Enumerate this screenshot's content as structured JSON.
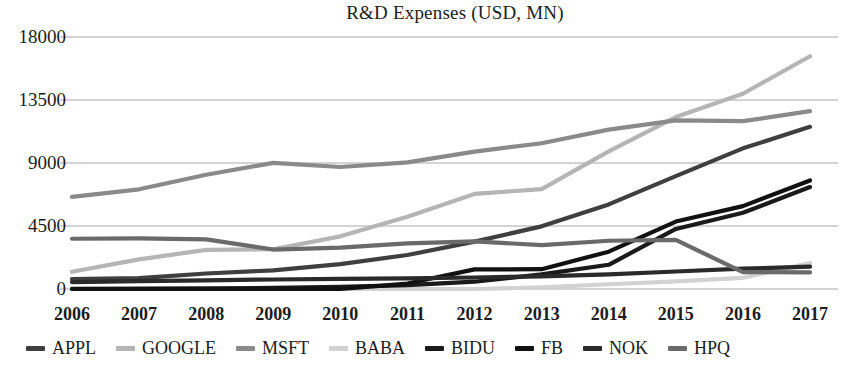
{
  "chart_data": {
    "type": "line",
    "title": "R&D Expenses (USD, MN)",
    "xlabel": "",
    "ylabel": "",
    "grid": true,
    "legend_position": "bottom",
    "categories": [
      "2006",
      "2007",
      "2008",
      "2009",
      "2010",
      "2011",
      "2012",
      "2013",
      "2014",
      "2015",
      "2016",
      "2017"
    ],
    "ylim": [
      0,
      18000
    ],
    "yticks": [
      0,
      4500,
      9000,
      13500,
      18000
    ],
    "ytick_labels": [
      "0",
      "4500",
      "9000",
      "13500",
      "18000"
    ],
    "series": [
      {
        "name": "APPL",
        "color": "#3f3f3f",
        "values": [
          712,
          782,
          1109,
          1333,
          1782,
          2429,
          3381,
          4475,
          6041,
          8067,
          10045,
          11581
        ]
      },
      {
        "name": "GOOGLE",
        "color": "#b5b5b5",
        "values": [
          1229,
          2119,
          2793,
          2843,
          3762,
          5162,
          6793,
          7137,
          9832,
          12282,
          13948,
          16625
        ]
      },
      {
        "name": "MSFT",
        "color": "#8a8a8a",
        "values": [
          6584,
          7121,
          8164,
          9010,
          8714,
          9043,
          9811,
          10411,
          11381,
          12046,
          11988,
          12700
        ]
      },
      {
        "name": "BABA",
        "color": "#d2d2d2",
        "values": [
          0,
          0,
          0,
          0,
          0,
          0,
          0,
          110,
          340,
          550,
          800,
          1850
        ]
      },
      {
        "name": "BIDU",
        "color": "#1a1a1a",
        "values": [
          12,
          25,
          48,
          75,
          150,
          280,
          520,
          1040,
          1730,
          4290,
          5450,
          7280
        ]
      },
      {
        "name": "FB",
        "color": "#111111",
        "values": [
          0,
          0,
          0,
          0,
          0,
          388,
          1399,
          1415,
          2666,
          4816,
          5919,
          7754
        ]
      },
      {
        "name": "NOK",
        "color": "#2a2a2a",
        "values": [
          498,
          560,
          620,
          680,
          720,
          760,
          820,
          900,
          1050,
          1250,
          1450,
          1600
        ]
      },
      {
        "name": "HPQ",
        "color": "#6a6a6a",
        "values": [
          3591,
          3611,
          3543,
          2819,
          2959,
          3254,
          3399,
          3135,
          3447,
          3502,
          1209,
          1190
        ]
      }
    ]
  },
  "legend": {
    "items": [
      {
        "label": "APPL"
      },
      {
        "label": "GOOGLE"
      },
      {
        "label": "MSFT"
      },
      {
        "label": "BABA"
      },
      {
        "label": "BIDU"
      },
      {
        "label": "FB"
      },
      {
        "label": "NOK"
      },
      {
        "label": "HPQ"
      }
    ]
  }
}
